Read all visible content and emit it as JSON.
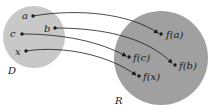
{
  "diagram": {
    "type": "function-mapping",
    "domain_set": {
      "label": "D",
      "color": "#c8c8c8"
    },
    "range_set": {
      "label": "R",
      "color": "#a0a0a0"
    },
    "domain_points": [
      {
        "id": "a",
        "label": "a"
      },
      {
        "id": "b",
        "label": "b"
      },
      {
        "id": "c",
        "label": "c"
      },
      {
        "id": "x",
        "label": "x"
      }
    ],
    "range_points": [
      {
        "id": "fa",
        "label": "f(a)"
      },
      {
        "id": "fb",
        "label": "f(b)"
      },
      {
        "id": "fc",
        "label": "f(c)"
      },
      {
        "id": "fx",
        "label": "f(x)"
      }
    ],
    "mappings": [
      {
        "from": "a",
        "to": "f(a)"
      },
      {
        "from": "b",
        "to": "f(b)"
      },
      {
        "from": "c",
        "to": "f(c)"
      },
      {
        "from": "x",
        "to": "f(x)"
      }
    ]
  }
}
